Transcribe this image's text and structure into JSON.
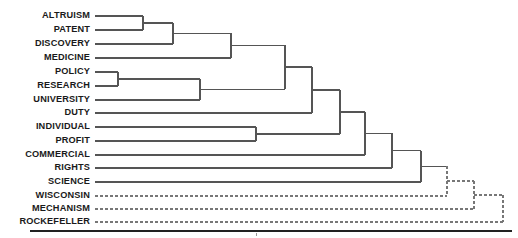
{
  "figure": {
    "kind": "dendrogram",
    "orientation": "horizontal-left-to-right",
    "background_color": "#ffffff",
    "line_color": "#555555",
    "dashed_line_color": "#777777",
    "axis_color": "#222222",
    "label_color": "#1a1a1a"
  },
  "chart_data": {
    "type": "dendrogram",
    "title": "",
    "subtitle": "",
    "xlabel": "",
    "ylabel": "",
    "grid": false,
    "legend": "none",
    "orientation": "horizontal",
    "leaf_count": 14,
    "xlim": [
      95,
      510
    ],
    "leaves": [
      {
        "index": 0,
        "label": "ALTRUISM",
        "y": 16,
        "line_style": "solid"
      },
      {
        "index": 1,
        "label": "PATENT",
        "y": 30,
        "line_style": "solid"
      },
      {
        "index": 2,
        "label": "DISCOVERY",
        "y": 44,
        "line_style": "solid"
      },
      {
        "index": 3,
        "label": "MEDICINE",
        "y": 58,
        "line_style": "solid"
      },
      {
        "index": 4,
        "label": "POLICY",
        "y": 72,
        "line_style": "solid"
      },
      {
        "index": 5,
        "label": "RESEARCH",
        "y": 86,
        "line_style": "solid"
      },
      {
        "index": 6,
        "label": "UNIVERSITY",
        "y": 100,
        "line_style": "solid"
      },
      {
        "index": 7,
        "label": "DUTY",
        "y": 113,
        "line_style": "solid"
      },
      {
        "index": 8,
        "label": "INDIVIDUAL",
        "y": 127,
        "line_style": "solid"
      },
      {
        "index": 9,
        "label": "PROFIT",
        "y": 141,
        "line_style": "solid"
      },
      {
        "index": 10,
        "label": "COMMERCIAL",
        "y": 155,
        "line_style": "solid"
      },
      {
        "index": 11,
        "label": "RIGHTS",
        "y": 168,
        "line_style": "solid"
      },
      {
        "index": 12,
        "label": "SCIENCE",
        "y": 182,
        "line_style": "solid"
      },
      {
        "index": 13,
        "label": "WISCONSIN",
        "y": 196,
        "line_style": "dashed"
      },
      {
        "index": 14,
        "label": "MECHANISM",
        "y": 209,
        "line_style": "dashed"
      },
      {
        "index": 15,
        "label": "ROCKEFELLER",
        "y": 222,
        "line_style": "dashed"
      }
    ],
    "leaf_line_start_x": 95,
    "label_right_x": 90,
    "merges": [
      {
        "id": "m1",
        "left": "ALTRUISM",
        "right": "PATENT",
        "x": 143,
        "y_top": 16,
        "y_bot": 30,
        "style": "solid"
      },
      {
        "id": "m2",
        "left": "m1",
        "right": "DISCOVERY",
        "x": 173,
        "y_top": 23,
        "y_bot": 44,
        "style": "solid"
      },
      {
        "id": "m3",
        "left": "m2",
        "right": "MEDICINE",
        "x": 231,
        "y_top": 33,
        "y_bot": 58,
        "style": "solid"
      },
      {
        "id": "m4",
        "left": "POLICY",
        "right": "RESEARCH",
        "x": 118,
        "y_top": 72,
        "y_bot": 86,
        "style": "solid"
      },
      {
        "id": "m5",
        "left": "m4",
        "right": "UNIVERSITY",
        "x": 200,
        "y_top": 79,
        "y_bot": 100,
        "style": "solid"
      },
      {
        "id": "m6",
        "left": "m3",
        "right": "m5",
        "x": 285,
        "y_top": 45,
        "y_bot": 89,
        "style": "solid"
      },
      {
        "id": "m7",
        "left": "m6",
        "right": "DUTY",
        "x": 312,
        "y_top": 67,
        "y_bot": 113,
        "style": "solid"
      },
      {
        "id": "m8",
        "left": "INDIVIDUAL",
        "right": "PROFIT",
        "x": 256,
        "y_top": 127,
        "y_bot": 141,
        "style": "solid"
      },
      {
        "id": "m9",
        "left": "m7",
        "right": "m8",
        "x": 340,
        "y_top": 90,
        "y_bot": 134,
        "style": "solid"
      },
      {
        "id": "m10",
        "left": "m9",
        "right": "COMMERCIAL",
        "x": 365,
        "y_top": 112,
        "y_bot": 155,
        "style": "solid"
      },
      {
        "id": "m11",
        "left": "m10",
        "right": "RIGHTS",
        "x": 392,
        "y_top": 133,
        "y_bot": 168,
        "style": "solid"
      },
      {
        "id": "m12",
        "left": "m11",
        "right": "SCIENCE",
        "x": 421,
        "y_top": 151,
        "y_bot": 182,
        "style": "solid"
      },
      {
        "id": "m13",
        "left": "m12",
        "right": "WISCONSIN",
        "x": 447,
        "y_top": 166,
        "y_bot": 196,
        "style": "dashed"
      },
      {
        "id": "m14",
        "left": "m13",
        "right": "MECHANISM",
        "x": 474,
        "y_top": 181,
        "y_bot": 209,
        "style": "dashed"
      },
      {
        "id": "m15",
        "left": "m14",
        "right": "ROCKEFELLER",
        "x": 503,
        "y_top": 195,
        "y_bot": 222,
        "style": "dashed"
      }
    ],
    "axis": {
      "y": 231,
      "x_start": 30,
      "x_end": 512,
      "thickness": 2.2,
      "ticks": [
        {
          "x": 256,
          "y": 233,
          "length": 3
        }
      ]
    }
  }
}
